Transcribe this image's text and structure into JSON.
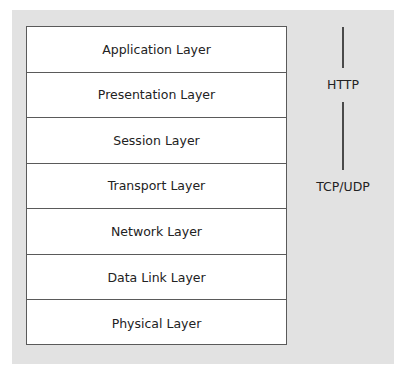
{
  "diagram": {
    "layers": [
      {
        "label": "Application Layer"
      },
      {
        "label": "Presentation Layer"
      },
      {
        "label": "Session Layer"
      },
      {
        "label": "Transport Layer"
      },
      {
        "label": "Network Layer"
      },
      {
        "label": "Data Link Layer"
      },
      {
        "label": "Physical Layer"
      }
    ],
    "protocols": {
      "http": "HTTP",
      "tcp_udp": "TCP/UDP"
    },
    "colors": {
      "panel": "#e2e2e2",
      "box": "#ffffff",
      "border": "#5a5a5a",
      "text": "#222222"
    }
  }
}
